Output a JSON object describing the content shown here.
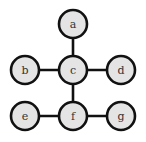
{
  "diagram": {
    "type": "graph",
    "colors": {
      "node_fill": "#e4e4e4",
      "stroke": "#111111",
      "label": "#333333",
      "background": "#ffffff"
    },
    "nodes": [
      {
        "id": "a",
        "label": "a",
        "x": 73,
        "y": 24
      },
      {
        "id": "b",
        "label": "b",
        "x": 25,
        "y": 70
      },
      {
        "id": "c",
        "label": "c",
        "x": 73,
        "y": 70
      },
      {
        "id": "d",
        "label": "d",
        "x": 121,
        "y": 70
      },
      {
        "id": "e",
        "label": "e",
        "x": 25,
        "y": 116
      },
      {
        "id": "f",
        "label": "f",
        "x": 73,
        "y": 116
      },
      {
        "id": "g",
        "label": "g",
        "x": 121,
        "y": 116
      }
    ],
    "edges": [
      [
        "a",
        "c"
      ],
      [
        "b",
        "c"
      ],
      [
        "c",
        "d"
      ],
      [
        "c",
        "f"
      ],
      [
        "e",
        "f"
      ],
      [
        "f",
        "g"
      ]
    ]
  }
}
